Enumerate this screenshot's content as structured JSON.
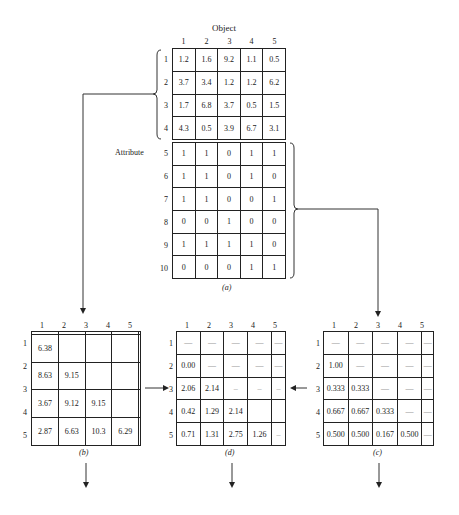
{
  "figure_a": {
    "column_header": "Object",
    "row_header": "Attribute",
    "caption": "(a)",
    "columns": [
      "1",
      "2",
      "3",
      "4",
      "5"
    ],
    "numeric_block": {
      "row_labels": [
        "1",
        "2",
        "3",
        "4"
      ],
      "rows": [
        [
          "1.2",
          "1.6",
          "9.2",
          "1.1",
          "0.5"
        ],
        [
          "3.7",
          "3.4",
          "1.2",
          "1.2",
          "6.2"
        ],
        [
          "1.7",
          "6.8",
          "3.7",
          "0.5",
          "1.5"
        ],
        [
          "4.3",
          "0.5",
          "3.9",
          "6.7",
          "3.1"
        ]
      ]
    },
    "binary_block": {
      "row_labels": [
        "5",
        "6",
        "7",
        "8",
        "9",
        "10"
      ],
      "rows": [
        [
          "1",
          "1",
          "0",
          "1",
          "1"
        ],
        [
          "1",
          "1",
          "0",
          "1",
          "0"
        ],
        [
          "1",
          "1",
          "0",
          "0",
          "1"
        ],
        [
          "0",
          "0",
          "1",
          "0",
          "0"
        ],
        [
          "1",
          "1",
          "1",
          "1",
          "0"
        ],
        [
          "0",
          "0",
          "0",
          "1",
          "1"
        ]
      ]
    }
  },
  "figure_b": {
    "caption": "(b)",
    "columns": [
      "1",
      "2",
      "3",
      "4",
      "5"
    ],
    "row_labels": [
      "1",
      "2",
      "3",
      "4",
      "5"
    ],
    "rows": [
      [
        "",
        "",
        "",
        "",
        ""
      ],
      [
        "6.38",
        "",
        "",
        "",
        ""
      ],
      [
        "8.63",
        "9.15",
        "",
        "",
        ""
      ],
      [
        "3.67",
        "9.12",
        "9.15",
        "",
        ""
      ],
      [
        "2.87",
        "6.63",
        "10.3",
        "6.29",
        ""
      ]
    ]
  },
  "figure_d": {
    "caption": "(d)",
    "columns": [
      "1",
      "2",
      "3",
      "4",
      "5"
    ],
    "row_labels": [
      "1",
      "2",
      "3",
      "4",
      "5"
    ],
    "rows": [
      [
        "—",
        "—",
        "—",
        "—",
        "—"
      ],
      [
        "0.00",
        "—",
        "—",
        "—",
        "—"
      ],
      [
        "2.06",
        "2.14",
        "–",
        "–",
        "–"
      ],
      [
        "0.42",
        "1.29",
        "2.14",
        "",
        ""
      ],
      [
        "0.71",
        "1.31",
        "2.75",
        "1.26",
        "–"
      ]
    ]
  },
  "figure_c": {
    "caption": "(c)",
    "columns": [
      "1",
      "2",
      "3",
      "4",
      "5"
    ],
    "row_labels": [
      "1",
      "2",
      "3",
      "4",
      "5"
    ],
    "rows": [
      [
        "—",
        "—",
        "—",
        "—",
        "—"
      ],
      [
        "1.00",
        "—",
        "—",
        "—",
        "—"
      ],
      [
        "0.333",
        "0.333",
        "—",
        "—",
        "—"
      ],
      [
        "0.667",
        "0.667",
        "0.333",
        "—",
        "—"
      ],
      [
        "0.500",
        "0.500",
        "0.167",
        "0.500",
        "—"
      ]
    ]
  }
}
